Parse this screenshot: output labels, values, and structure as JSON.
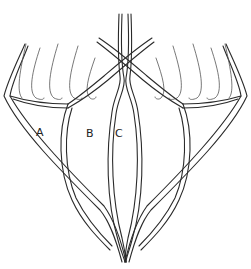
{
  "figure": {
    "labels": [
      {
        "id": "A",
        "text": "A",
        "x": 36,
        "y": 133
      },
      {
        "id": "B",
        "text": "B",
        "x": 86,
        "y": 131
      },
      {
        "id": "C",
        "text": "C",
        "x": 116,
        "y": 131
      }
    ],
    "colors": {
      "line": "#2a2a2a",
      "background": "#ffffff"
    }
  }
}
